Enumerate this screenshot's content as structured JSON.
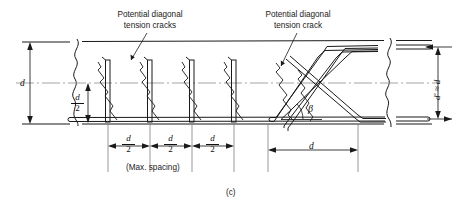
{
  "figure": {
    "caption": "(c)"
  },
  "annotations": {
    "left_note_line1": "Potential diagonal",
    "left_note_line2": "tension cracks",
    "right_note_line1": "Potential diagonal",
    "right_note_line2": "tension crack",
    "max_spacing_note": "(Max. spacing)"
  },
  "dimensions": {
    "overall_depth": "d",
    "half_depth_numerator": "d",
    "half_depth_denominator": "2",
    "stirrup_spacing": [
      {
        "numerator": "d",
        "denominator": "2"
      },
      {
        "numerator": "d",
        "denominator": "2"
      },
      {
        "numerator": "d",
        "denominator": "2"
      }
    ],
    "bent_bar_extent": "d",
    "right_depth_label": "d' ≈ d"
  },
  "angles": {
    "bent_bar_angle": "β"
  },
  "colors": {
    "line": "#1a1a1a",
    "centerline": "#8a8a8a",
    "background": "#ffffff"
  }
}
